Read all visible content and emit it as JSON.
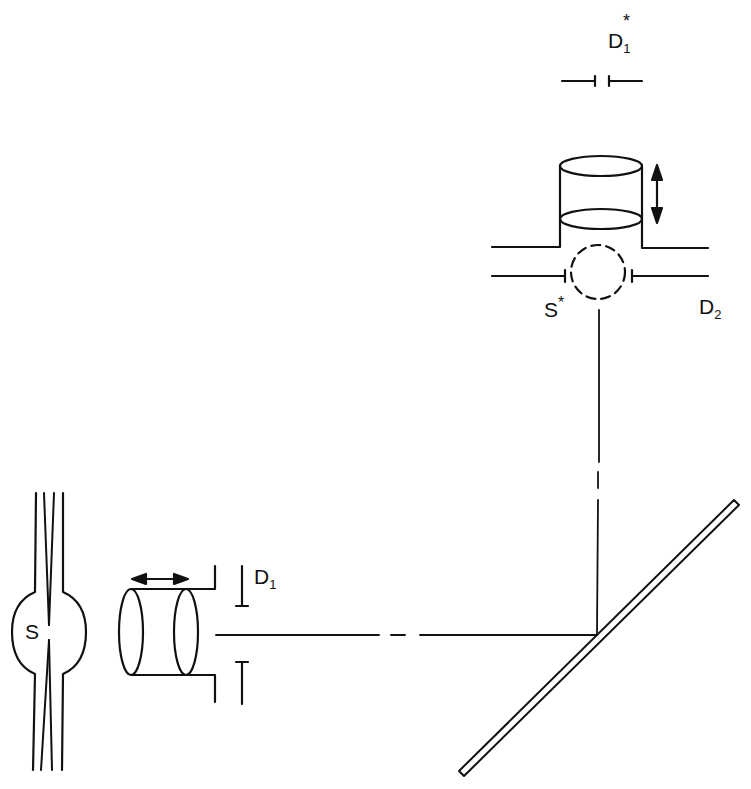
{
  "diagram": {
    "type": "optical-schematic",
    "background": "#ffffff",
    "stroke_color": "#111111",
    "labels": {
      "source": {
        "base": "S",
        "sup": ""
      },
      "source_image": {
        "base": "S",
        "sup": "*"
      },
      "diaphragm_1": {
        "base": "D",
        "sub": "1"
      },
      "diaphragm_1_image": {
        "base": "D",
        "sub": "1",
        "sup": "*"
      },
      "diaphragm_2": {
        "base": "D",
        "sub": "2"
      }
    },
    "components": [
      {
        "id": "source-lamp",
        "label": "S"
      },
      {
        "id": "horizontal-lens-cylinder",
        "motion": "horizontal double arrow"
      },
      {
        "id": "diaphragm-D1",
        "label": "D1"
      },
      {
        "id": "mirror",
        "orientation": "45 degrees"
      },
      {
        "id": "vertical-lens-cylinder",
        "motion": "vertical double arrow"
      },
      {
        "id": "image-source",
        "label": "S*",
        "style": "dashed circle"
      },
      {
        "id": "diaphragm-D2",
        "label": "D2"
      },
      {
        "id": "diaphragm-D1-image",
        "label": "D1*"
      }
    ]
  }
}
